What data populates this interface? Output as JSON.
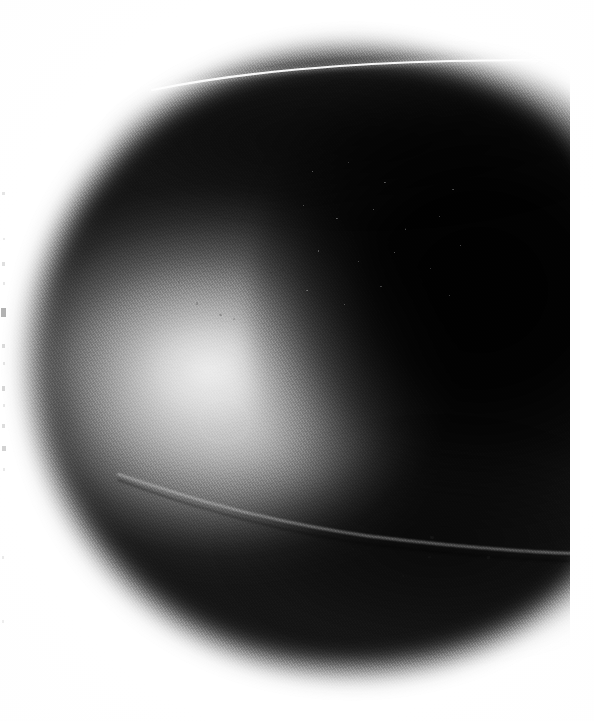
{
  "image": {
    "kind": "halftone-printed-photograph",
    "medium": "black-and-white halftone print, scanned",
    "subject": "dark smooth ellipsoidal object (stone / pebble) lit from the left",
    "background": "white paper",
    "width_px": 594,
    "height_px": 721,
    "alt_text": "Close-up black and white halftone photograph of a large smooth dark ellipsoidal object filling most of the frame on a white background, with a bright highlight on its left flank and deep shadow on the right."
  },
  "colors": {
    "paper": "#ffffff",
    "object_core": "#151515",
    "deepest_shadow": "#000000",
    "highlight": "#f2f2f2",
    "midtone": "#6e6e6e",
    "speck": "#282828"
  },
  "regions": [
    {
      "name": "object-body",
      "label": "Ellipsoidal object",
      "bounds_px": {
        "x": 32,
        "y": 52,
        "w": 538,
        "h": 618
      },
      "tone": "dark"
    },
    {
      "name": "specular-highlight",
      "label": "Bright specular highlight on left flank",
      "bounds_px": {
        "x": 60,
        "y": 200,
        "w": 290,
        "h": 270
      },
      "tone": "light"
    },
    {
      "name": "deep-shadow-right",
      "label": "Deep shadow mass at right",
      "bounds_px": {
        "x": 300,
        "y": 120,
        "w": 270,
        "h": 420
      },
      "tone": "black"
    },
    {
      "name": "top-contour-seam",
      "label": "Thin bright seam along upper contour",
      "bounds_px": {
        "x": 150,
        "y": 54,
        "w": 430,
        "h": 40
      },
      "tone": "light"
    },
    {
      "name": "lower-curved-line",
      "label": "Faint light curved line across lower body",
      "bounds_px": {
        "x": 118,
        "y": 450,
        "w": 470,
        "h": 130
      },
      "tone": "light"
    },
    {
      "name": "round-mark",
      "label": "Faint circular mark on lower-left belly",
      "bounds_px": {
        "x": 198,
        "y": 398,
        "w": 48,
        "h": 42
      },
      "tone": "light"
    },
    {
      "name": "speckle-patch",
      "label": "Mottled speckled texture in upper middle",
      "bounds_px": {
        "x": 286,
        "y": 150,
        "w": 190,
        "h": 180
      },
      "tone": "dark"
    },
    {
      "name": "right-margin",
      "label": "White page margin cropping the print",
      "bounds_px": {
        "x": 570,
        "y": 0,
        "w": 24,
        "h": 721
      },
      "tone": "paper"
    }
  ],
  "edge_marks": [
    {
      "y": 192,
      "h": 3,
      "w": 3,
      "x": 2,
      "o": 0.3
    },
    {
      "y": 238,
      "h": 2,
      "w": 2,
      "x": 3,
      "o": 0.22
    },
    {
      "y": 262,
      "h": 4,
      "w": 3,
      "x": 2,
      "o": 0.35
    },
    {
      "y": 282,
      "h": 3,
      "w": 2,
      "x": 3,
      "o": 0.25
    },
    {
      "y": 308,
      "h": 9,
      "w": 5,
      "x": 1,
      "o": 0.85
    },
    {
      "y": 344,
      "h": 4,
      "w": 3,
      "x": 2,
      "o": 0.4
    },
    {
      "y": 362,
      "h": 3,
      "w": 2,
      "x": 3,
      "o": 0.28
    },
    {
      "y": 386,
      "h": 5,
      "w": 3,
      "x": 2,
      "o": 0.45
    },
    {
      "y": 404,
      "h": 3,
      "w": 2,
      "x": 3,
      "o": 0.26
    },
    {
      "y": 424,
      "h": 4,
      "w": 3,
      "x": 2,
      "o": 0.38
    },
    {
      "y": 446,
      "h": 5,
      "w": 4,
      "x": 2,
      "o": 0.5
    },
    {
      "y": 468,
      "h": 3,
      "w": 2,
      "x": 3,
      "o": 0.24
    },
    {
      "y": 556,
      "h": 3,
      "w": 2,
      "x": 2,
      "o": 0.26
    },
    {
      "y": 620,
      "h": 3,
      "w": 2,
      "x": 2,
      "o": 0.22
    }
  ],
  "specks": [
    {
      "x": 219,
      "y": 314,
      "w": 3,
      "h": 2,
      "o": 0.52
    },
    {
      "x": 233,
      "y": 318,
      "w": 2,
      "h": 2,
      "o": 0.4
    },
    {
      "x": 178,
      "y": 281,
      "w": 2,
      "h": 2,
      "o": 0.34
    },
    {
      "x": 196,
      "y": 302,
      "w": 2,
      "h": 3,
      "o": 0.44
    },
    {
      "x": 270,
      "y": 272,
      "w": 2,
      "h": 2,
      "o": 0.3
    },
    {
      "x": 281,
      "y": 268,
      "w": 3,
      "h": 2,
      "o": 0.36
    },
    {
      "x": 430,
      "y": 536,
      "w": 4,
      "h": 3,
      "o": 0.6
    },
    {
      "x": 487,
      "y": 556,
      "w": 3,
      "h": 3,
      "o": 0.55
    },
    {
      "x": 428,
      "y": 556,
      "w": 3,
      "h": 2,
      "o": 0.45
    },
    {
      "x": 523,
      "y": 550,
      "w": 3,
      "h": 2,
      "o": 0.4
    },
    {
      "x": 402,
      "y": 575,
      "w": 2,
      "h": 2,
      "o": 0.35
    },
    {
      "x": 352,
      "y": 548,
      "w": 2,
      "h": 2,
      "o": 0.3
    }
  ]
}
